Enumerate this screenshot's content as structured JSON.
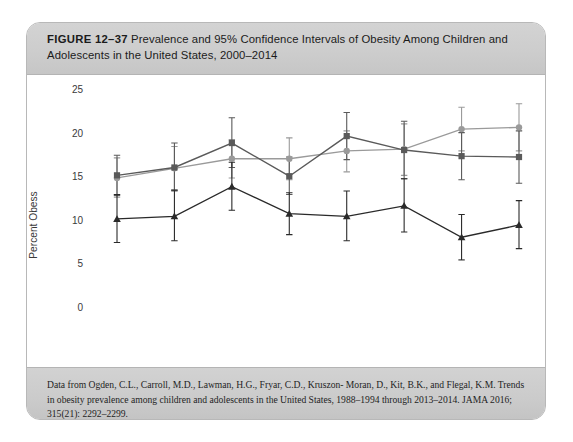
{
  "figure": {
    "label": "FIGURE 12–37",
    "title_rest": "Prevalence and 95% Confidence Intervals of Obesity Among Children and Adolescents in the United States, 2000–2014",
    "source": "Data from Ogden, C.L., Carroll, M.D., Lawman, H.G., Fryar, C.D., Kruszon- Moran, D., Kit, B.K., and Flegal, K.M. Trends in obesity prevalence among children and adolescents in the United States, 1988–1994 through 2013–2014. JAMA 2016; 315(21): 2292–2299."
  },
  "colors": {
    "series_2_5": "#2a2a2a",
    "series_6_11": "#5a5a5a",
    "series_12_19": "#9a9a9a",
    "axis": "#8c8c8c",
    "band": "#cdcdcd",
    "panel": "#ffffff"
  },
  "chart_data": {
    "type": "line",
    "title": "Prevalence and 95% Confidence Intervals of Obesity Among Children and Adolescents in the United States, 2000–2014",
    "xlabel": "",
    "ylabel": "Percent Obess",
    "x": [
      2000,
      2002,
      2004,
      2006,
      2008,
      2010,
      2012,
      2014
    ],
    "xticklabels": [
      "2000",
      "2002",
      "2004",
      "2006",
      "2008",
      "2010",
      "2012",
      "2014"
    ],
    "yticks": [
      0,
      5,
      10,
      15,
      20,
      25
    ],
    "yticklabels": [
      "0",
      "5",
      "10",
      "15",
      "20",
      "25"
    ],
    "ylim": [
      0,
      25
    ],
    "xlim": [
      2000,
      2014
    ],
    "grid": false,
    "legend_position": "bottom",
    "error_bars": "95% confidence interval",
    "series": [
      {
        "name": "2–5 years",
        "marker": "triangle",
        "color": "#2a2a2a",
        "values": [
          10.1,
          10.4,
          13.8,
          10.7,
          10.4,
          11.6,
          8.0,
          9.4
        ],
        "ci_low": [
          7.4,
          7.6,
          11.1,
          8.3,
          7.6,
          8.6,
          5.4,
          6.7
        ],
        "ci_high": [
          12.9,
          13.4,
          16.6,
          13.1,
          13.3,
          14.7,
          10.6,
          12.2
        ]
      },
      {
        "name": "6–11 years",
        "marker": "square",
        "color": "#5a5a5a",
        "values": [
          15.1,
          16.0,
          18.8,
          15.0,
          19.6,
          18.0,
          17.3,
          17.2
        ],
        "ci_low": [
          12.8,
          13.3,
          16.0,
          12.9,
          16.9,
          14.7,
          14.6,
          14.2
        ],
        "ci_high": [
          17.4,
          18.8,
          21.7,
          17.2,
          22.3,
          21.3,
          20.0,
          20.2
        ]
      },
      {
        "name": "12–19 years",
        "marker": "circle",
        "color": "#9a9a9a",
        "values": [
          14.8,
          15.9,
          17.0,
          17.0,
          17.9,
          18.1,
          20.4,
          20.6
        ],
        "ci_low": [
          12.6,
          13.4,
          14.8,
          14.6,
          15.5,
          15.1,
          17.9,
          17.9
        ],
        "ci_high": [
          17.1,
          18.4,
          19.2,
          19.4,
          20.2,
          21.0,
          22.9,
          23.3
        ]
      }
    ]
  },
  "legend": {
    "items": [
      {
        "label": "2–5 years",
        "marker": "triangle",
        "color": "#2a2a2a"
      },
      {
        "label": "6–11 years",
        "marker": "square",
        "color": "#5a5a5a"
      },
      {
        "label": "12–19 years",
        "marker": "circle",
        "color": "#9a9a9a"
      }
    ]
  }
}
